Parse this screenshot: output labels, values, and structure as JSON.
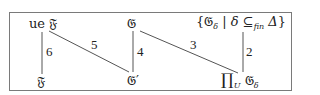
{
  "diagram": {
    "type": "lattice-diagram",
    "nodes": {
      "ue_F": {
        "prefix": "ue",
        "symbol": "𝔉"
      },
      "G": {
        "symbol": "𝔊"
      },
      "set_G": {
        "open": "{",
        "symbol": "𝔊",
        "sub": "δ",
        "sep": " | ",
        "var": "δ",
        "rel": " ⊆",
        "rel_sub": "fin",
        "set": " Δ",
        "close": "}"
      },
      "F": {
        "symbol": "𝔉"
      },
      "G_prime": {
        "symbol": "𝔊′"
      },
      "prod": {
        "op": "∏",
        "op_sub": "U",
        "symbol": " 𝔊",
        "sub": "δ"
      }
    },
    "edges": [
      {
        "from": "ue_F",
        "to": "F",
        "label": "6"
      },
      {
        "from": "ue_F",
        "to": "G_prime",
        "label": "5"
      },
      {
        "from": "G",
        "to": "G_prime",
        "label": "4"
      },
      {
        "from": "G",
        "to": "prod",
        "label": "3"
      },
      {
        "from": "set_G",
        "to": "prod",
        "label": "2"
      }
    ],
    "colors": {
      "line": "#555555",
      "border": "#7a7a7a",
      "text": "#222222"
    }
  }
}
